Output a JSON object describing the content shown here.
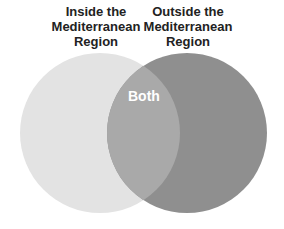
{
  "diagram": {
    "type": "venn",
    "sets": [
      {
        "name": "left",
        "label_lines": [
          "Inside the",
          "Mediterranean",
          "Region"
        ],
        "color": "#e3e3e3"
      },
      {
        "name": "right",
        "label_lines": [
          "Outside the",
          "Mediterranean",
          "Region"
        ],
        "color": "#8f8f8f"
      }
    ],
    "intersection": {
      "label": "Both",
      "color": "#a9a9a9"
    }
  }
}
